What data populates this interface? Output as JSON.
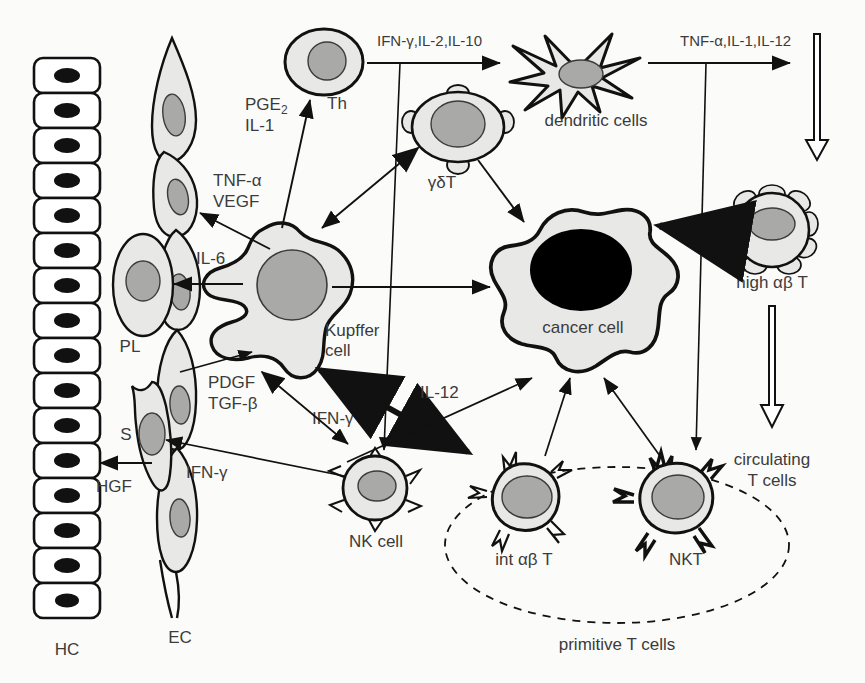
{
  "diagram": {
    "background_color": "#fbfbfa",
    "cell_fill": "#e8e8e6",
    "nucleus_fill": "#a9a9a7",
    "outline_color": "#000000",
    "label_color": "#3b3b3b"
  },
  "cells": {
    "hc": {
      "label": "HC",
      "count": 16,
      "nucleus": "black-oval"
    },
    "ec": {
      "label": "EC",
      "count": 5,
      "shape": "spindle"
    },
    "pl": {
      "label": "PL",
      "shape": "oval"
    },
    "s": {
      "label": "S",
      "shape": "spindle"
    },
    "th": {
      "label": "Th",
      "shape": "oval"
    },
    "gd_t": {
      "label": "γδT",
      "shape": "oval-with-bumps"
    },
    "dendritic": {
      "label": "dendritic cells",
      "shape": "star"
    },
    "kupffer": {
      "label_line1": "Kupffer",
      "label_line2": "cell",
      "shape": "amoeboid"
    },
    "cancer": {
      "label": "cancer cell",
      "shape": "amoeboid",
      "nucleus": "black-large"
    },
    "high_ab_t": {
      "label": "high αβ T",
      "shape": "round-with-loops"
    },
    "nk": {
      "label": "NK cell",
      "shape": "round-with-spikes"
    },
    "int_ab_t": {
      "label": "int αβ T",
      "shape": "round-with-spikes"
    },
    "nkt": {
      "label": "NKT",
      "shape": "round-with-thick-spikes"
    },
    "circulating": {
      "label_line1": "circulating",
      "label_line2": "T cells"
    },
    "primitive_group": {
      "label": "primitive T cells",
      "boundary": "dashed-ellipse"
    }
  },
  "cytokines": {
    "pge2_il1": {
      "line1": "PGE",
      "sub": "2",
      "line2": "IL-1"
    },
    "tnfa_vegf": {
      "line1": "TNF-α",
      "line2": "VEGF"
    },
    "il6": "IL-6",
    "ifng_il2_il10": "IFN-γ,IL-2,IL-10",
    "tnfa_il1_il12": "TNF-α,IL-1,IL-12",
    "pdgf_tgfb": {
      "line1": "PDGF",
      "line2": "TGF-β"
    },
    "ifng_a": "IFN-γ",
    "ifng_b": "IFN-γ",
    "hgf": "HGF",
    "il12": "IL-12"
  }
}
